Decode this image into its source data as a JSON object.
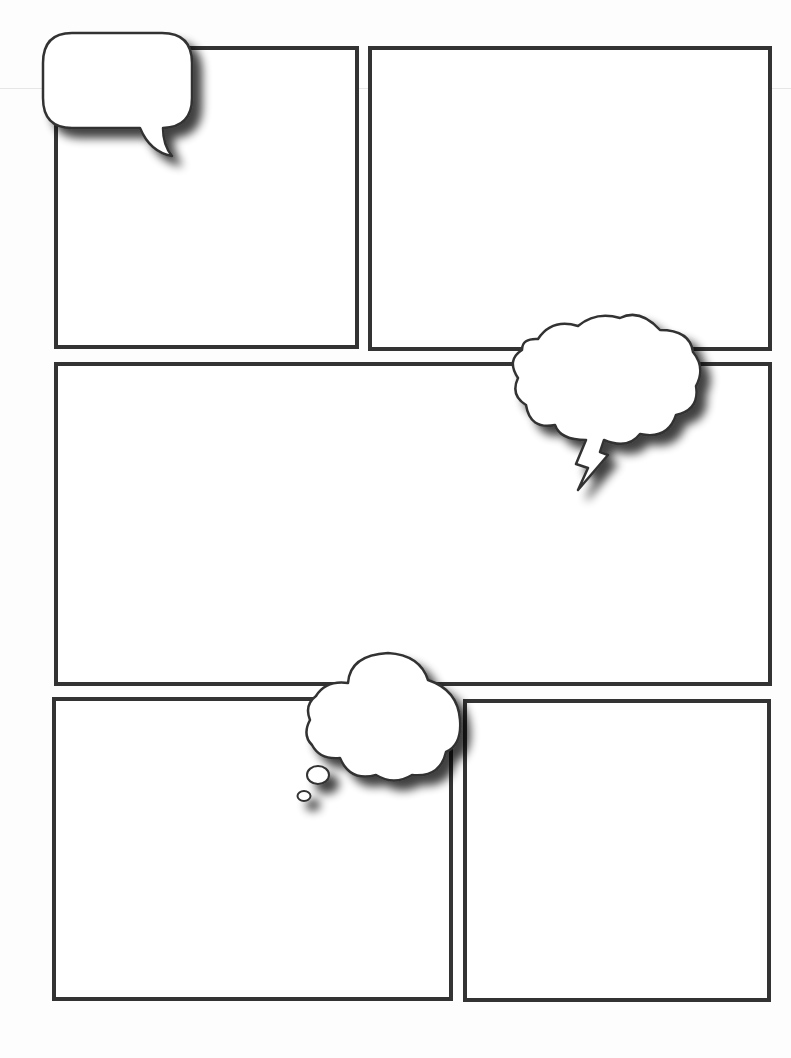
{
  "page": {
    "width": 791,
    "height": 1058,
    "background": "#fdfdfd",
    "border_color": "#333333",
    "border_width": 4
  },
  "panels": [
    {
      "id": "panel-1",
      "x": 56,
      "y": 48,
      "w": 301,
      "h": 299
    },
    {
      "id": "panel-2",
      "x": 370,
      "y": 48,
      "w": 400,
      "h": 301
    },
    {
      "id": "panel-3",
      "x": 56,
      "y": 364,
      "w": 714,
      "h": 320
    },
    {
      "id": "panel-4",
      "x": 54,
      "y": 699,
      "w": 397,
      "h": 300
    },
    {
      "id": "panel-5",
      "x": 465,
      "y": 701,
      "w": 304,
      "h": 299
    }
  ],
  "bubbles": [
    {
      "id": "speech-bubble",
      "type": "speech",
      "x": 42,
      "y": 32,
      "w": 150,
      "h": 98,
      "text": ""
    },
    {
      "id": "exclaim-cloud-bubble",
      "type": "cloud-lightning",
      "x": 512,
      "y": 314,
      "w": 192,
      "h": 178,
      "text": ""
    },
    {
      "id": "thought-cloud-bubble",
      "type": "thought",
      "x": 296,
      "y": 651,
      "w": 168,
      "h": 152,
      "text": ""
    }
  ]
}
